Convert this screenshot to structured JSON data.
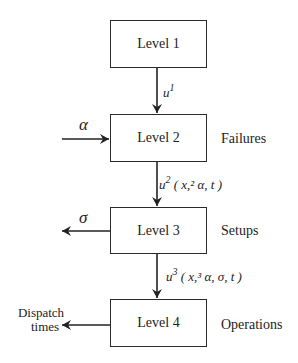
{
  "levels": [
    {
      "label": "Level 1",
      "side_label": ""
    },
    {
      "label": "Level 2",
      "side_label": "Failures"
    },
    {
      "label": "Level 3",
      "side_label": "Setups"
    },
    {
      "label": "Level 4",
      "side_label": "Operations"
    }
  ],
  "arrows": {
    "l1_to_l2": {
      "base": "u",
      "sup": "1",
      "args": ""
    },
    "l2_to_l3": {
      "base": "u",
      "sup": "2",
      "args": "( x,² α, t )"
    },
    "l3_to_l4": {
      "base": "u",
      "sup": "3",
      "args": "( x,³ α, σ, t )"
    }
  },
  "inputs": {
    "alpha": "α",
    "sigma": "σ",
    "dispatch_line1": "Dispatch",
    "dispatch_line2": "times"
  }
}
